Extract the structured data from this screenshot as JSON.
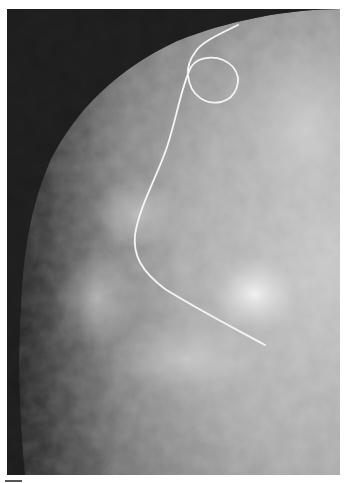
{
  "image": {
    "kind": "mammogram",
    "description": "Grayscale breast X-ray (mammogram) with a thin white localization hookwire; the wire forms a loop near the top and its tip ends adjacent to a bright dense mass in the lower center-right.",
    "colors": {
      "background_air": "#1c1c1c",
      "tissue_dark": "#5a5a5a",
      "tissue_mid": "#9a9a9a",
      "tissue_bright": "#d8d8d8",
      "mass": "#f2f2f2",
      "wire": "#f5f5f5",
      "page": "#ffffff"
    },
    "wire_path": "M231 16 C215 26 193 34 187 46 C180 56 178 66 180 74 C184 92 200 98 214 94 C230 88 232 66 220 56 C208 46 190 48 182 60 C172 80 168 110 158 140 C148 170 130 200 127 228 C126 248 134 262 158 280 C190 300 225 318 258 336",
    "mass_center": [
      255,
      285
    ],
    "wire_loop": {
      "cx": 205,
      "cy": 70,
      "r": 27
    }
  }
}
